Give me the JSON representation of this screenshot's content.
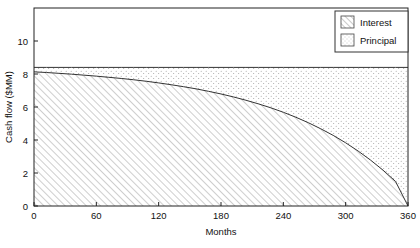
{
  "chart_data": {
    "type": "area",
    "title": "",
    "subtitle": "",
    "xlabel": "Months",
    "ylabel": "Cash flow ($MM)",
    "xlim": [
      0,
      360
    ],
    "ylim": [
      0,
      12
    ],
    "grid": false,
    "stacked": true,
    "legend_position": "top-right",
    "xticks": [
      0,
      60,
      120,
      180,
      240,
      300,
      360
    ],
    "xtick_labels": [
      "0",
      "60",
      "120",
      "180",
      "240",
      "300",
      "360"
    ],
    "yticks": [
      0,
      2,
      4,
      6,
      8,
      10
    ],
    "ytick_labels": [
      "0",
      "2",
      "4",
      "6",
      "8",
      "10"
    ],
    "total_payment": 8.4,
    "x": [
      0,
      12,
      24,
      36,
      48,
      60,
      72,
      84,
      96,
      108,
      120,
      132,
      144,
      156,
      168,
      180,
      192,
      204,
      216,
      228,
      240,
      252,
      264,
      276,
      288,
      300,
      312,
      324,
      336,
      348,
      360
    ],
    "series": [
      {
        "name": "Interest",
        "pattern": "diagonal-hatch",
        "color": "#666666",
        "values": [
          8.13,
          8.09,
          8.04,
          7.99,
          7.93,
          7.87,
          7.8,
          7.73,
          7.65,
          7.56,
          7.46,
          7.35,
          7.23,
          7.1,
          6.95,
          6.79,
          6.61,
          6.41,
          6.19,
          5.95,
          5.68,
          5.38,
          5.05,
          4.68,
          4.28,
          3.83,
          3.33,
          2.78,
          2.17,
          1.49,
          0.0
        ]
      },
      {
        "name": "Principal",
        "pattern": "dot-stipple",
        "color": "#999999",
        "values": [
          0.27,
          0.31,
          0.36,
          0.41,
          0.47,
          0.53,
          0.6,
          0.67,
          0.75,
          0.84,
          0.94,
          1.05,
          1.17,
          1.3,
          1.45,
          1.61,
          1.79,
          1.99,
          2.21,
          2.45,
          2.72,
          3.02,
          3.35,
          3.72,
          4.12,
          4.57,
          5.07,
          5.62,
          6.23,
          6.91,
          8.4
        ]
      }
    ]
  },
  "legend": {
    "entries": [
      {
        "label": "Interest",
        "swatch": "diagonal-hatch-swatch"
      },
      {
        "label": "Principal",
        "swatch": "dot-stipple-swatch"
      }
    ]
  },
  "axes": {
    "x_title": "Months",
    "y_title": "Cash flow ($MM)"
  },
  "colors": {
    "axis": "#222222",
    "interest": "#666666",
    "principal": "#999999",
    "background": "#ffffff"
  }
}
